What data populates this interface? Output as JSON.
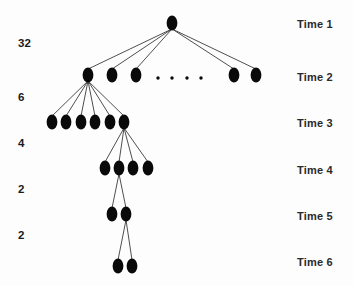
{
  "diagram": {
    "node_color": "#0a0a0a",
    "edge_color": "#3b3b3b",
    "background_color": "#fdfdfd",
    "ellipsis_symbol": "· · · ·",
    "count_labels": [
      {
        "value": "32",
        "x": 18,
        "y": 37
      },
      {
        "value": "6",
        "x": 18,
        "y": 91
      },
      {
        "value": "4",
        "x": 18,
        "y": 137
      },
      {
        "value": "2",
        "x": 18,
        "y": 183
      },
      {
        "value": "2",
        "x": 18,
        "y": 229
      }
    ],
    "time_labels": [
      {
        "label": "Time 1",
        "x": 297,
        "y": 18
      },
      {
        "label": "Time 2",
        "x": 297,
        "y": 71
      },
      {
        "label": "Time 3",
        "x": 297,
        "y": 117
      },
      {
        "label": "Time 4",
        "x": 297,
        "y": 164
      },
      {
        "label": "Time 5",
        "x": 297,
        "y": 210
      },
      {
        "label": "Time 6",
        "x": 297,
        "y": 256
      }
    ],
    "levels": [
      {
        "time": "Time 1",
        "y": 23,
        "node_count": 1,
        "node_x": [
          172
        ]
      },
      {
        "time": "Time 2",
        "y": 75,
        "node_count": 5,
        "node_x": [
          88,
          112,
          136,
          234,
          256
        ]
      },
      {
        "time": "Time 3",
        "y": 122,
        "node_count": 6,
        "node_x": [
          52,
          66,
          81,
          95,
          110,
          124
        ]
      },
      {
        "time": "Time 4",
        "y": 168,
        "node_count": 4,
        "node_x": [
          105,
          119,
          133,
          148
        ]
      },
      {
        "time": "Time 5",
        "y": 214,
        "node_count": 2,
        "node_x": [
          112,
          126
        ]
      },
      {
        "time": "Time 6",
        "y": 266,
        "node_count": 2,
        "node_x": [
          118,
          132
        ]
      }
    ],
    "ellipsis_dots": [
      {
        "x": 158,
        "y": 78
      },
      {
        "x": 172,
        "y": 78
      },
      {
        "x": 187,
        "y": 78
      },
      {
        "x": 201,
        "y": 78
      }
    ],
    "node_radius_x": 5.4,
    "node_radius_y": 7.6,
    "edges": [
      {
        "from": [
          172,
          23
        ],
        "to": [
          88,
          75
        ]
      },
      {
        "from": [
          172,
          23
        ],
        "to": [
          112,
          75
        ]
      },
      {
        "from": [
          172,
          23
        ],
        "to": [
          136,
          75
        ]
      },
      {
        "from": [
          172,
          23
        ],
        "to": [
          234,
          75
        ]
      },
      {
        "from": [
          172,
          23
        ],
        "to": [
          256,
          75
        ]
      },
      {
        "from": [
          88,
          75
        ],
        "to": [
          52,
          122
        ]
      },
      {
        "from": [
          88,
          75
        ],
        "to": [
          66,
          122
        ]
      },
      {
        "from": [
          88,
          75
        ],
        "to": [
          81,
          122
        ]
      },
      {
        "from": [
          88,
          75
        ],
        "to": [
          95,
          122
        ]
      },
      {
        "from": [
          88,
          75
        ],
        "to": [
          110,
          122
        ]
      },
      {
        "from": [
          88,
          75
        ],
        "to": [
          124,
          122
        ]
      },
      {
        "from": [
          124,
          122
        ],
        "to": [
          105,
          168
        ]
      },
      {
        "from": [
          124,
          122
        ],
        "to": [
          119,
          168
        ]
      },
      {
        "from": [
          124,
          122
        ],
        "to": [
          133,
          168
        ]
      },
      {
        "from": [
          124,
          122
        ],
        "to": [
          148,
          168
        ]
      },
      {
        "from": [
          119,
          168
        ],
        "to": [
          112,
          214
        ]
      },
      {
        "from": [
          119,
          168
        ],
        "to": [
          126,
          214
        ]
      },
      {
        "from": [
          126,
          214
        ],
        "to": [
          118,
          266
        ]
      },
      {
        "from": [
          126,
          214
        ],
        "to": [
          132,
          266
        ]
      }
    ]
  }
}
